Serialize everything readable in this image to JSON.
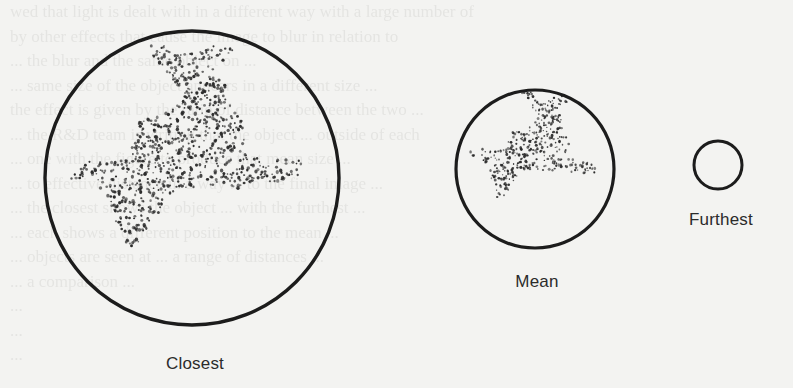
{
  "figure": {
    "background": "#f3f3f1",
    "ink": "#1c1c1c",
    "stipple_color": "#2a2a2a",
    "views": [
      {
        "id": "closest",
        "label": "Closest",
        "cx": 192,
        "cy": 178,
        "r": 147,
        "stroke": 3.4,
        "has_object": true,
        "label_x": 195,
        "label_y": 354,
        "dot_count": 900,
        "dot_r": 1.25
      },
      {
        "id": "mean",
        "label": "Mean",
        "cx": 535,
        "cy": 169,
        "r": 79,
        "stroke": 3.2,
        "has_object": true,
        "label_x": 537,
        "label_y": 272,
        "dot_count": 420,
        "dot_r": 1.05
      },
      {
        "id": "furthest",
        "label": "Furthest",
        "cx": 718,
        "cy": 165,
        "r": 24,
        "stroke": 3.0,
        "has_object": false,
        "label_x": 721,
        "label_y": 210,
        "dot_count": 0,
        "dot_r": 0
      }
    ],
    "object_outline_normalized": [
      [
        -0.32,
        -0.89
      ],
      [
        -0.22,
        -0.92
      ],
      [
        -0.1,
        -0.84
      ],
      [
        0.04,
        -0.85
      ],
      [
        0.17,
        -0.91
      ],
      [
        0.3,
        -0.92
      ],
      [
        0.26,
        -0.83
      ],
      [
        0.12,
        -0.72
      ],
      [
        0.0,
        -0.63
      ],
      [
        0.14,
        -0.7
      ],
      [
        0.24,
        -0.66
      ],
      [
        0.22,
        -0.55
      ],
      [
        0.3,
        -0.44
      ],
      [
        0.38,
        -0.32
      ],
      [
        0.33,
        -0.18
      ],
      [
        0.46,
        -0.13
      ],
      [
        0.63,
        -0.13
      ],
      [
        0.74,
        -0.12
      ],
      [
        0.74,
        0.0
      ],
      [
        0.6,
        0.02
      ],
      [
        0.43,
        0.03
      ],
      [
        0.31,
        0.08
      ],
      [
        0.22,
        0.04
      ],
      [
        0.06,
        0.06
      ],
      [
        -0.1,
        0.07
      ],
      [
        -0.18,
        0.14
      ],
      [
        -0.25,
        0.28
      ],
      [
        -0.32,
        0.42
      ],
      [
        -0.44,
        0.49
      ],
      [
        -0.47,
        0.38
      ],
      [
        -0.55,
        0.24
      ],
      [
        -0.58,
        0.09
      ],
      [
        -0.72,
        0.02
      ],
      [
        -0.85,
        0.0
      ],
      [
        -0.88,
        -0.05
      ],
      [
        -0.72,
        -0.11
      ],
      [
        -0.58,
        -0.11
      ],
      [
        -0.44,
        -0.14
      ],
      [
        -0.38,
        -0.28
      ],
      [
        -0.36,
        -0.38
      ],
      [
        -0.25,
        -0.42
      ],
      [
        -0.12,
        -0.48
      ],
      [
        -0.07,
        -0.57
      ],
      [
        -0.15,
        -0.7
      ],
      [
        -0.24,
        -0.8
      ]
    ],
    "mean_object_transform": {
      "scale": 1.0,
      "rotate_deg": 8,
      "dx": 0.02,
      "dy": -0.05
    }
  },
  "bleed_through_text": [
    "                 ",
    "    wed that light is dealt with in a different way with a large number of",
    "         by other effects that cause the image to blur in relation to",
    "              ...  the blur and the same object on ...",
    "           ... same size of the object appears in a different size ...",
    "     the effect is given by the ratio of distance between the two ...",
    "     ... the R&D team is writing that the object ... outside of each",
    "     ... one with the figure to produce that mean size ...",
    "     ... to effective distance in a way ... to the final image ...",
    "     ... the closest shows the object ... with the furthest ...",
    "          ... each shows a different position to the mean ...",
    "     ... objects are seen at ... a range of distances ...",
    "     ... a comparison ... ",
    "     ...",
    "     ...",
    "     ..."
  ]
}
